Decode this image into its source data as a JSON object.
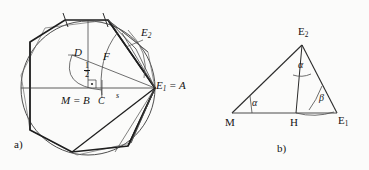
{
  "figure": {
    "caption_a": "a)",
    "caption_b": "b)",
    "stroke_color": "#2b2b2b",
    "thin_color": "#4a4a4a",
    "background": "#fbfbfa"
  },
  "panel_a": {
    "labels": {
      "center": "M = B",
      "point_d": "D",
      "point_c": "C",
      "point_f": "F",
      "point_s": "s",
      "point_e1": "E",
      "point_e1_sub": "1",
      "point_e1_eq": " = A",
      "point_e2": "E",
      "point_e2_sub": "2",
      "half_num": "1",
      "half_den": "2"
    }
  },
  "panel_b": {
    "labels": {
      "vertex_m": "M",
      "vertex_h": "H",
      "vertex_e1": "E",
      "vertex_e1_sub": "1",
      "vertex_e2": "E",
      "vertex_e2_sub": "2",
      "angle_at_m": "α",
      "angle_at_e2": "α",
      "angle_at_e1": "β"
    }
  }
}
